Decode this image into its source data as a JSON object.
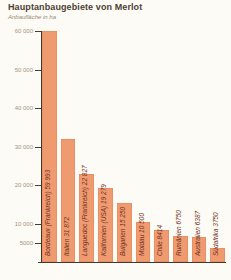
{
  "header": {
    "title": "Hauptanbaugebiete von Merlot",
    "subtitle": "Anbaufläche in ha"
  },
  "chart_data": {
    "type": "bar",
    "title": "Hauptanbaugebiete von Merlot",
    "ylabel": "Anbaufläche in ha",
    "xlabel": "",
    "ylim": [
      0,
      60000
    ],
    "grid": false,
    "legend": "none",
    "yticks": [
      {
        "value": 60000,
        "label": "60 000"
      },
      {
        "value": 50000,
        "label": "50 000"
      },
      {
        "value": 40000,
        "label": "40 000"
      },
      {
        "value": 30000,
        "label": "30 000"
      },
      {
        "value": 20000,
        "label": "20 000"
      },
      {
        "value": 10000,
        "label": "10 000"
      },
      {
        "value": 5000,
        "label": "5000"
      }
    ],
    "categories": [
      "Bordeaux (Frankreich)",
      "Italien",
      "Languedoc (Frankreich)",
      "Kalifornien (USA)",
      "Bulgarien",
      "Moldau",
      "Chile",
      "Rumänien",
      "Australien",
      "Südafrika"
    ],
    "values": [
      59993,
      31872,
      22827,
      19279,
      15250,
      10500,
      8414,
      6750,
      6387,
      3750
    ],
    "bars": [
      {
        "category": "Bordeaux (Frankreich)",
        "value": 59993,
        "label": "Bordeaux (Frankreich) 59 993"
      },
      {
        "category": "Italien",
        "value": 31872,
        "label": "Italien 31 872"
      },
      {
        "category": "Languedoc (Frankreich)",
        "value": 22827,
        "label": "Languedoc (Frankreich) 22 827"
      },
      {
        "category": "Kalifornien (USA)",
        "value": 19279,
        "label": "Kalifornien (USA) 19 279"
      },
      {
        "category": "Bulgarien",
        "value": 15250,
        "label": "Bulgarien 15 250"
      },
      {
        "category": "Moldau",
        "value": 10500,
        "label": "Moldau 10 500"
      },
      {
        "category": "Chile",
        "value": 8414,
        "label": "Chile 8414"
      },
      {
        "category": "Rumänien",
        "value": 6750,
        "label": "Rumänien 6750"
      },
      {
        "category": "Australien",
        "value": 6387,
        "label": "Australien 6387"
      },
      {
        "category": "Südafrika",
        "value": 3750,
        "label": "Südafrika 3750"
      }
    ],
    "colors": {
      "bar_fill": "#F09A70",
      "bar_edge": "#E0835A",
      "bar_label_text": "#6E3122",
      "axis_line": "#42382C",
      "tick_label_text": "#A59381",
      "title_text": "#4D4134",
      "background": "#FDFBF5"
    }
  }
}
